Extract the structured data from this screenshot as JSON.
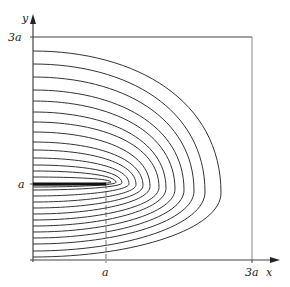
{
  "diagram": {
    "axes": {
      "x_label": "x",
      "y_label": "y",
      "x_ticks": [
        "a",
        "3a"
      ],
      "y_ticks": [
        "a",
        "3a"
      ]
    },
    "box": {
      "left": 33,
      "right": 252,
      "top": 37,
      "bottom": 260
    },
    "plate": {
      "x_start": 33,
      "x_end": 106,
      "y": 184,
      "label": "conductor edge at (a, a)"
    },
    "tip": {
      "x": 106,
      "y": 184
    },
    "curves": [
      {
        "top": 51,
        "bottom": 257,
        "extent": 221
      },
      {
        "top": 64,
        "bottom": 251,
        "extent": 205
      },
      {
        "top": 77,
        "bottom": 244,
        "extent": 194
      },
      {
        "top": 90,
        "bottom": 238,
        "extent": 184
      },
      {
        "top": 101,
        "bottom": 232,
        "extent": 175
      },
      {
        "top": 112,
        "bottom": 226,
        "extent": 166
      },
      {
        "top": 122,
        "bottom": 220,
        "extent": 159
      },
      {
        "top": 132,
        "bottom": 214,
        "extent": 150
      },
      {
        "top": 142,
        "bottom": 208,
        "extent": 143
      },
      {
        "top": 150,
        "bottom": 202,
        "extent": 136
      },
      {
        "top": 158,
        "bottom": 196,
        "extent": 129
      },
      {
        "top": 165,
        "bottom": 190,
        "extent": 122
      },
      {
        "top": 171,
        "bottom": 187,
        "extent": 116
      },
      {
        "top": 177,
        "bottom": 185,
        "extent": 111
      }
    ],
    "colors": {
      "line": "#333333",
      "plate": "#111111",
      "axis": "#555555"
    }
  }
}
